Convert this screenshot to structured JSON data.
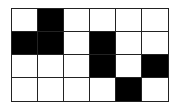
{
  "grid": {
    "rows": 4,
    "cols": 6,
    "fill_color": "#000000",
    "empty_color": "#ffffff",
    "line_color": "#222222",
    "cells": [
      [
        0,
        1,
        0,
        0,
        0,
        0
      ],
      [
        1,
        1,
        0,
        1,
        0,
        0
      ],
      [
        0,
        0,
        0,
        1,
        0,
        1
      ],
      [
        0,
        0,
        0,
        0,
        1,
        0
      ]
    ]
  }
}
